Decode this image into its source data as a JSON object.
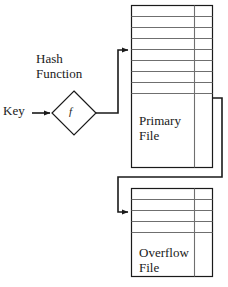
{
  "diagram": {
    "type": "flow-diagram",
    "colors": {
      "stroke": "#1a1a1a",
      "inner_rule": "#6f6f6f",
      "background": "#ffffff"
    },
    "labels": {
      "key": "Key",
      "hash_function_line1": "Hash",
      "hash_function_line2": "Function",
      "hash_symbol": "f",
      "primary_file_line1": "Primary",
      "primary_file_line2": "File",
      "overflow_file_line1": "Overflow",
      "overflow_file_line2": "File"
    },
    "nodes": [
      {
        "id": "key-input",
        "name": "key-input-label",
        "text": "Key",
        "x": 3,
        "y": 103
      },
      {
        "id": "hash-diamond",
        "name": "hash-function-diamond",
        "text": "f",
        "cx": 74,
        "cy": 113,
        "half": 22
      },
      {
        "id": "primary-file",
        "name": "primary-file-block",
        "text": "Primary File",
        "x": 131,
        "y": 5,
        "w": 82,
        "h": 163,
        "rules": 8
      },
      {
        "id": "overflow-file",
        "name": "overflow-file-block",
        "text": "Overflow File",
        "x": 131,
        "y": 188,
        "w": 82,
        "h": 89,
        "rules": 4
      }
    ],
    "edges": [
      {
        "id": "key-to-hash",
        "name": "key-to-hash-arrow",
        "from": "key-input",
        "to": "hash-diamond"
      },
      {
        "id": "hash-to-primary",
        "name": "hash-to-primary-arrow",
        "from": "hash-diamond",
        "to": "primary-file"
      },
      {
        "id": "primary-to-overflow",
        "name": "primary-to-overflow-arrow",
        "from": "primary-file",
        "to": "overflow-file"
      }
    ]
  }
}
